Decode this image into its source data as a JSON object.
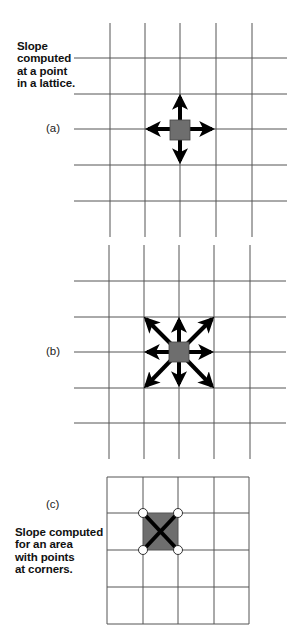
{
  "figure": {
    "caption_top": [
      "Slope",
      "computed",
      "at a point",
      "in a lattice."
    ],
    "caption_bottom": [
      "Slope computed",
      "for an area",
      "with points",
      "at corners."
    ],
    "panels": [
      {
        "id": "a",
        "label": "(a)",
        "description": "Point in lattice with 4 neighbor arrows (N, E, S, W)",
        "directions": [
          "N",
          "E",
          "S",
          "W"
        ]
      },
      {
        "id": "b",
        "label": "(b)",
        "description": "Point in lattice with 8 neighbor arrows (N, NE, E, SE, S, SW, W, NW)",
        "directions": [
          "N",
          "NE",
          "E",
          "SE",
          "S",
          "SW",
          "W",
          "NW"
        ]
      },
      {
        "id": "c",
        "label": "(c)",
        "description": "Area cell with points at its four corners, connected by an X",
        "corner_points": 4
      }
    ],
    "colors": {
      "grid": "#555555",
      "cell_fill": "#6e6e6e",
      "arrow": "#000000",
      "corner_point_fill": "#ffffff"
    }
  }
}
